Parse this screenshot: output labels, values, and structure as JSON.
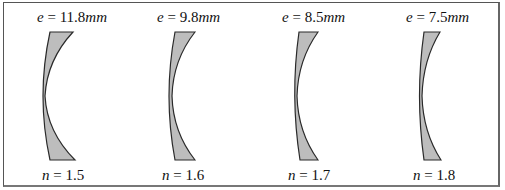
{
  "figure": {
    "fill_color": "#bdbdbd",
    "stroke_color": "#2a2a2a",
    "lenses": [
      {
        "e_var": "e",
        "e_eq": " = 11.8",
        "e_unit": "mm",
        "n_var": "n",
        "n_eq": " = 1.5",
        "thickness_mm": 11.8,
        "index": 1.5
      },
      {
        "e_var": "e",
        "e_eq": " = 9.8",
        "e_unit": "mm",
        "n_var": "n",
        "n_eq": " = 1.6",
        "thickness_mm": 9.8,
        "index": 1.6
      },
      {
        "e_var": "e",
        "e_eq": " = 8.5",
        "e_unit": "mm",
        "n_var": "n",
        "n_eq": " = 1.7",
        "thickness_mm": 8.5,
        "index": 1.7
      },
      {
        "e_var": "e",
        "e_eq": " = 7.5",
        "e_unit": "mm",
        "n_var": "n",
        "n_eq": " = 1.8",
        "thickness_mm": 7.5,
        "index": 1.8
      }
    ]
  }
}
